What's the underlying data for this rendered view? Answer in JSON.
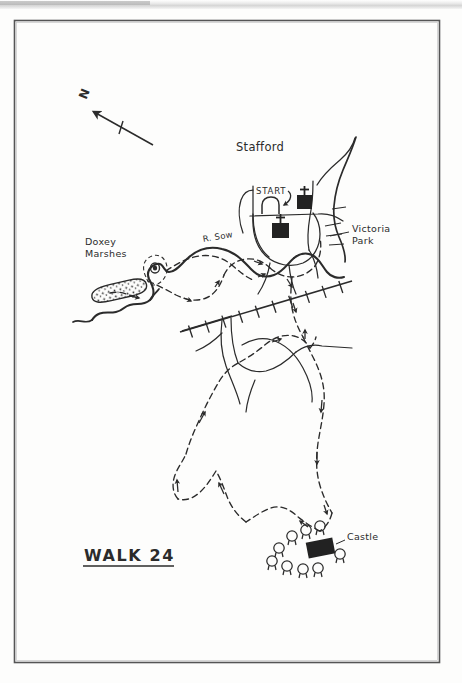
{
  "document": {
    "type": "hand-drawn walking route map",
    "title": "WALK 24",
    "title_underlined": true,
    "background_color": "#fdfdfc",
    "ink_color": "#2b2b2b",
    "frame": {
      "x": 14,
      "y": 20,
      "width": 426,
      "height": 643,
      "border_color": "#555555"
    }
  },
  "labels": {
    "walk_title": "WALK 24",
    "town": "Stafford",
    "start": "START",
    "river": "R. Sow",
    "marshes": "Doxey\nMarshes",
    "park": "Victoria\nPark",
    "castle": "Castle",
    "north": "N"
  },
  "label_positions": {
    "walk_title": {
      "x": 84,
      "y": 553
    },
    "town": {
      "x": 236,
      "y": 147
    },
    "start": {
      "x": 257,
      "y": 192
    },
    "river": {
      "x": 203,
      "y": 240
    },
    "marshes": {
      "x": 86,
      "y": 243
    },
    "park": {
      "x": 353,
      "y": 229
    },
    "castle": {
      "x": 347,
      "y": 536
    },
    "north": {
      "x": 78,
      "y": 102
    }
  },
  "map_features": {
    "north_arrow": {
      "name": "north-arrow",
      "from": {
        "x": 153,
        "y": 145
      },
      "to": {
        "x": 89,
        "y": 109
      },
      "tick": true
    },
    "churches": [
      {
        "name": "church-symbol-north",
        "x": 297,
        "y": 194,
        "width": 15,
        "height": 14
      },
      {
        "name": "church-symbol-south",
        "x": 272,
        "y": 222,
        "width": 17,
        "height": 15
      }
    ],
    "castle_building": {
      "x": 307,
      "y": 540,
      "width": 26,
      "height": 16,
      "rotation": -12
    },
    "trees": [
      {
        "x": 279,
        "y": 549
      },
      {
        "x": 291,
        "y": 536
      },
      {
        "x": 305,
        "y": 531
      },
      {
        "x": 318,
        "y": 527
      },
      {
        "x": 273,
        "y": 562
      },
      {
        "x": 288,
        "y": 566
      },
      {
        "x": 303,
        "y": 570
      },
      {
        "x": 318,
        "y": 556
      },
      {
        "x": 311,
        "y": 567
      }
    ],
    "pond": {
      "name": "stippled-marsh-pond",
      "x": 88,
      "y": 289,
      "width": 58,
      "height": 17,
      "rotation": -14
    },
    "railway": {
      "name": "railway-line",
      "tick_count": 14,
      "from": {
        "x": 182,
        "y": 331
      },
      "to": {
        "x": 348,
        "y": 282
      }
    },
    "route": {
      "name": "walking-route",
      "style": "dashed",
      "arrow_count": 12
    },
    "rivers": {
      "name": "river-sow",
      "style": "solid-thick"
    }
  },
  "legend_semantics": {
    "dashed_line": "walking route",
    "solid_thick_line": "river",
    "hatched_line": "railway",
    "black_square_with_cross": "church",
    "black_rectangle": "castle",
    "circle_with_stem": "tree"
  }
}
